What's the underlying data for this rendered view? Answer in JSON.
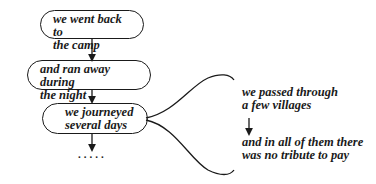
{
  "nodes": [
    {
      "line1": "we went back to",
      "line2": "the camp"
    },
    {
      "line1": "and ran away during",
      "line2": "the night"
    },
    {
      "line1": "we journeyed",
      "line2": "several days"
    }
  ],
  "continuation": ".....",
  "branch": {
    "first": {
      "line1": "we passed through",
      "line2": "a few villages"
    },
    "second": {
      "line1": "and in all of them there",
      "line2": "was no tribute to pay"
    }
  }
}
